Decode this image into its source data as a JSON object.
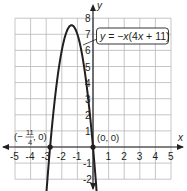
{
  "chart_data": {
    "type": "line",
    "title": "",
    "xlabel": "x",
    "ylabel": "y",
    "xlim": [
      -5,
      5
    ],
    "ylim": [
      -2,
      8
    ],
    "grid": true,
    "x_ticks": [
      "-5",
      "-4",
      "-3",
      "-2",
      "-1",
      "1",
      "2",
      "3",
      "4",
      "5"
    ],
    "y_ticks": [
      "-2",
      "-1",
      "1",
      "2",
      "3",
      "4",
      "5",
      "6",
      "7",
      "8"
    ],
    "series": [
      {
        "name": "y = -x(4x + 11)",
        "equation": "y = -x(4x + 11)",
        "a": -4,
        "b": -11,
        "c": 0,
        "vertex": [
          -1.375,
          7.5625
        ],
        "x_domain": [
          -3.05,
          0.3
        ],
        "arrows_both_ends": true
      }
    ],
    "annotations": [
      {
        "text": "y = -x(4x + 11)",
        "type": "equation-box"
      },
      {
        "text": "(-11/4, 0)",
        "x": -2.75,
        "y": 0,
        "type": "point"
      },
      {
        "text": "(0, 0)",
        "x": 0,
        "y": 0,
        "type": "point"
      }
    ],
    "colors": {
      "curve": "#231f20",
      "grid": "#b8b8b8",
      "axis": "#231f20"
    }
  },
  "labels": {
    "x_axis": "x",
    "y_axis": "y",
    "equation": {
      "prefix": "y = ",
      "body": "−x(4x + 11)"
    },
    "root_left": {
      "open": "(−",
      "num": "11",
      "den": "4",
      "close": ", 0)"
    },
    "root_origin": "(0, 0)"
  }
}
